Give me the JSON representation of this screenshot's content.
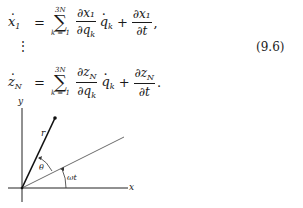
{
  "equations": [
    {
      "lhs": "x",
      "lhs_sub": "1",
      "sum_upper": "3N",
      "sum_lower": "k = 1",
      "frac1_num": "∂x₁",
      "frac1_den": "∂q",
      "frac1_den_sub": "k",
      "qdot": "q",
      "qdot_sub": "k",
      "frac2_num": "∂x₁",
      "frac2_den": "∂t",
      "trail": ","
    },
    {
      "lhs": "z",
      "lhs_sub": "N",
      "sum_upper": "3N",
      "sum_lower": "k = 1",
      "frac1_num": "∂z",
      "frac1_num_sub": "N",
      "frac1_den": "∂q",
      "frac1_den_sub": "k",
      "qdot": "q",
      "qdot_sub": "k",
      "frac2_num": "∂z",
      "frac2_num_sub": "N",
      "frac2_den": "∂t",
      "trail": "."
    }
  ],
  "vdots": "⋮",
  "equation_number": "(9.6)",
  "diagram": {
    "labels": {
      "y_axis": "y",
      "x_axis": "x",
      "radius": "r",
      "theta": "θ",
      "omega_t": "ωt"
    },
    "geometry": {
      "origin": [
        22,
        188
      ],
      "y_axis": [
        [
          22,
          108
        ],
        [
          22,
          202
        ]
      ],
      "x_axis": [
        [
          8,
          188
        ],
        [
          128,
          188
        ]
      ],
      "r_end": [
        55,
        118
      ],
      "rotating_axis_end": [
        124,
        137
      ]
    }
  }
}
